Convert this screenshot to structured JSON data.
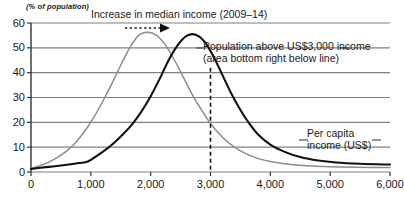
{
  "chart_data": {
    "type": "line",
    "title": "",
    "xlabel": "Per capita income (US$)",
    "ylabel": "(% of population)",
    "xlim": [
      0,
      6000
    ],
    "ylim": [
      0,
      60
    ],
    "xticks": [
      "0",
      "1,000",
      "2,000",
      "3,000",
      "4,000",
      "5,000",
      "6,000"
    ],
    "xtick_values": [
      0,
      1000,
      2000,
      3000,
      4000,
      5000,
      6000
    ],
    "yticks": [
      "0",
      "10",
      "20",
      "30",
      "40",
      "50",
      "60"
    ],
    "ytick_values": [
      0,
      10,
      20,
      30,
      40,
      50,
      60
    ],
    "grid": true,
    "legend": "none",
    "series": [
      {
        "name": "2009 income distribution",
        "color": "#8c8c8c",
        "points": [
          [
            0,
            1.5
          ],
          [
            150,
            2.5
          ],
          [
            300,
            4.0
          ],
          [
            450,
            6.0
          ],
          [
            600,
            8.5
          ],
          [
            750,
            12.0
          ],
          [
            900,
            16.5
          ],
          [
            1050,
            22.0
          ],
          [
            1200,
            28.5
          ],
          [
            1350,
            35.5
          ],
          [
            1500,
            43.0
          ],
          [
            1650,
            50.0
          ],
          [
            1800,
            55.0
          ],
          [
            1950,
            56.3
          ],
          [
            2100,
            55.0
          ],
          [
            2250,
            51.0
          ],
          [
            2400,
            45.0
          ],
          [
            2550,
            38.0
          ],
          [
            2700,
            31.0
          ],
          [
            2850,
            25.0
          ],
          [
            3000,
            19.5
          ],
          [
            3200,
            14.0
          ],
          [
            3400,
            10.0
          ],
          [
            3600,
            7.3
          ],
          [
            3800,
            5.4
          ],
          [
            4000,
            4.2
          ],
          [
            4300,
            3.1
          ],
          [
            4600,
            2.5
          ],
          [
            5000,
            2.1
          ],
          [
            5400,
            1.9
          ],
          [
            6000,
            1.8
          ]
        ]
      },
      {
        "name": "2014 income distribution",
        "color": "#111111",
        "points": [
          [
            0,
            1.2
          ],
          [
            200,
            1.8
          ],
          [
            400,
            2.3
          ],
          [
            600,
            2.9
          ],
          [
            800,
            3.6
          ],
          [
            950,
            4.2
          ],
          [
            1100,
            6.5
          ],
          [
            1250,
            9.0
          ],
          [
            1400,
            12.0
          ],
          [
            1550,
            15.5
          ],
          [
            1700,
            19.5
          ],
          [
            1850,
            24.5
          ],
          [
            2000,
            30.5
          ],
          [
            2150,
            37.5
          ],
          [
            2300,
            45.0
          ],
          [
            2450,
            51.0
          ],
          [
            2600,
            54.8
          ],
          [
            2750,
            55.3
          ],
          [
            2900,
            52.5
          ],
          [
            3050,
            46.5
          ],
          [
            3200,
            39.0
          ],
          [
            3350,
            31.5
          ],
          [
            3500,
            25.0
          ],
          [
            3650,
            19.5
          ],
          [
            3800,
            15.0
          ],
          [
            4000,
            11.0
          ],
          [
            4250,
            8.0
          ],
          [
            4500,
            6.0
          ],
          [
            4800,
            4.6
          ],
          [
            5100,
            3.8
          ],
          [
            5500,
            3.3
          ],
          [
            6000,
            3.0
          ]
        ]
      }
    ],
    "marker_line": {
      "name": "US$3,000 threshold",
      "x_value": 3000,
      "style": "dashed",
      "y_top": 42,
      "y_bottom": 0
    },
    "annotations": [
      {
        "id": "median-shift",
        "text": "Increase in median income (2009–14)",
        "arrow": "dotted-right-arrow"
      },
      {
        "id": "population-threshold",
        "line1": "Population above US$3,000 income",
        "line2": "(area bottom right below line)"
      },
      {
        "id": "per-capita-axis",
        "line1": "Per capita",
        "line2": "income (US$)"
      }
    ],
    "colors": {
      "grid": "#808080",
      "axis": "#333333",
      "series_2009": "#8c8c8c",
      "series_2014": "#111111",
      "background": "#ffffff"
    }
  }
}
